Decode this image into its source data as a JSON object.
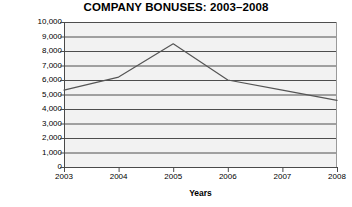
{
  "chart_data": {
    "type": "line",
    "title": "COMPANY BONUSES: 2003–2008",
    "xlabel": "Years",
    "ylabel": "Dollars",
    "categories": [
      "2003",
      "2004",
      "2005",
      "2006",
      "2007",
      "2008"
    ],
    "values": [
      5300,
      6200,
      8500,
      6000,
      5300,
      4600
    ],
    "series": [
      {
        "name": "Bonuses",
        "values": [
          5300,
          6200,
          8500,
          6000,
          5300,
          4600
        ]
      }
    ],
    "ylim": [
      0,
      10000
    ],
    "ytick_labels": [
      "10,000",
      "9,000",
      "8,000",
      "7,000",
      "6,000",
      "5,000",
      "4,000",
      "3,000",
      "2,000",
      "1,000",
      "0"
    ],
    "ytick_values": [
      10000,
      9000,
      8000,
      7000,
      6000,
      5000,
      4000,
      3000,
      2000,
      1000,
      0
    ],
    "xtick_labels": [
      "2003",
      "2004",
      "2005",
      "2006",
      "2007",
      "2008"
    ],
    "grid": true,
    "legend": false,
    "line_color": "#555555",
    "grid_color": "#3a3a3a",
    "plot_bg_color": "#f2f2f2",
    "axis_color": "#4a4a4a",
    "text_color": "#000000"
  }
}
